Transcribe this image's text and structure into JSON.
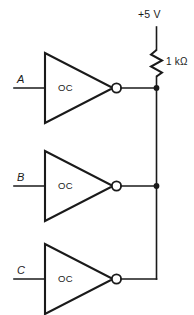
{
  "diagram": {
    "supply": {
      "label": "+5 V",
      "node_name": "supply-rail"
    },
    "resistor": {
      "label": "1 kΩ",
      "name": "pull-up-resistor"
    },
    "gates": [
      {
        "id": "gate-a",
        "body_label": "OC",
        "input_label": "A",
        "has_output_junction": true
      },
      {
        "id": "gate-b",
        "body_label": "OC",
        "input_label": "B",
        "has_output_junction": true
      },
      {
        "id": "gate-c",
        "body_label": "OC",
        "input_label": "C",
        "has_output_junction": false
      }
    ],
    "colors": {
      "ink": "#1a1a1a",
      "background": "#ffffff"
    }
  }
}
